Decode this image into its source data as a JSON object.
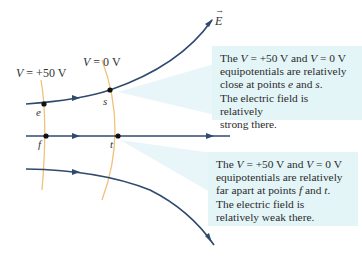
{
  "field_label": "E",
  "potentials": [
    {
      "label": "V = +50 V",
      "var": "V",
      "rest": " = +50 V"
    },
    {
      "label": "V = 0 V",
      "var": "V",
      "rest": " = 0 V"
    }
  ],
  "points": {
    "e": "e",
    "s": "s",
    "f": "f",
    "t": "t"
  },
  "callouts": {
    "top": {
      "line1_a": "The ",
      "line1_v1": "V",
      "line1_b": " = +50 V and ",
      "line1_v2": "V",
      "line1_c": " = 0 V",
      "line2": "equipotentials are relatively",
      "line3_a": "close at points ",
      "line3_e": "e",
      "line3_b": " and ",
      "line3_s": "s",
      "line3_c": ".",
      "line4": "The electric field is relatively",
      "line5": "strong there."
    },
    "bottom": {
      "line1_a": "The ",
      "line1_v1": "V",
      "line1_b": " = +50 V and ",
      "line1_v2": "V",
      "line1_c": " = 0 V",
      "line2": "equipotentials are relatively",
      "line3_a": "far apart at points ",
      "line3_f": "f",
      "line3_b": " and ",
      "line3_t": "t",
      "line3_c": ".",
      "line4": "The electric field is",
      "line5": "relatively weak there."
    }
  },
  "colors": {
    "field_line": "#2f4a6e",
    "equipotential": "#f0c27a",
    "callout_bg": "#e4f5f8",
    "highlight": "#d5eff4"
  }
}
